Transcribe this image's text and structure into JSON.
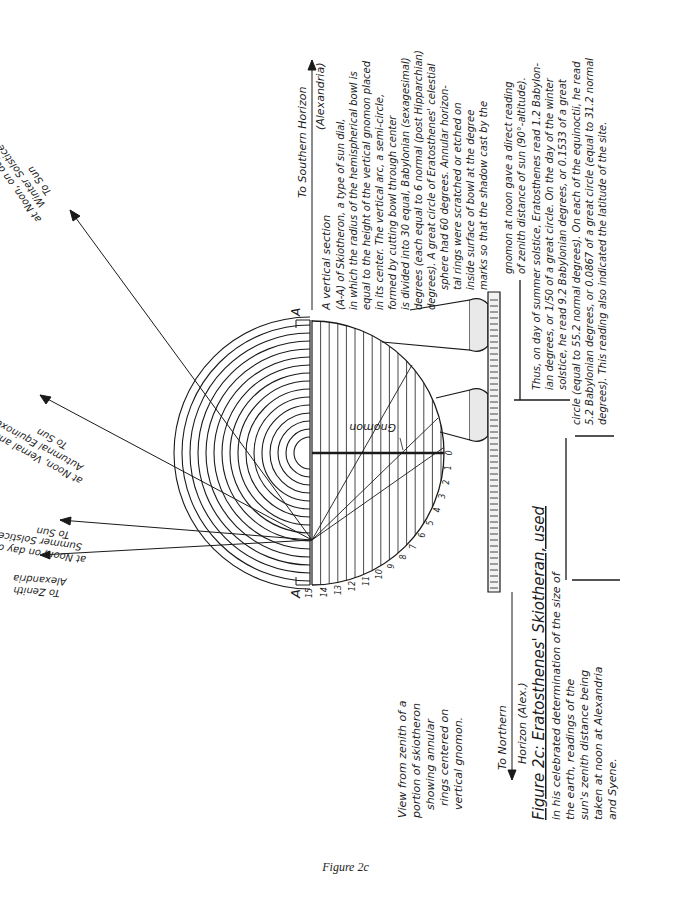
{
  "caption": "Figure 2c",
  "diagram": {
    "title": "Figure 2c: Eratosthenes' Skiotheran, used",
    "title_continuation": [
      "in his celebrated determination of the size of",
      "the earth, readings of the",
      "sun's zenith distance being",
      "taken at noon at Alexandria",
      "and Syene."
    ],
    "plan_view_label": [
      "View from zenith of a",
      "portion of skiotheron",
      "showing annular",
      "rings centered on",
      "vertical gnomon."
    ],
    "section_marker_left": "A",
    "section_marker_right": "A",
    "gnomon_label": "Gnomon",
    "scale_ticks": [
      "0",
      "1",
      "2",
      "3",
      "4",
      "5",
      "6",
      "7",
      "8",
      "9",
      "10",
      "11",
      "12",
      "13",
      "14",
      "15"
    ],
    "north_arrow_label": [
      "To Northern",
      "Horizon (Alex.)"
    ],
    "south_arrow_label": [
      "To Southern Horizon",
      "(Alexandria)"
    ],
    "rays": [
      {
        "id": "zenith",
        "label": [
          "To Zenith",
          "Alexandria"
        ]
      },
      {
        "id": "summer",
        "label": [
          "To Sun",
          "at Noon, on day of",
          "Summer Solstice"
        ]
      },
      {
        "id": "equinox",
        "label": [
          "To Sun",
          "at Noon, Vernal and",
          "Autumnal Equinoxes"
        ]
      },
      {
        "id": "winter",
        "label": [
          "To Sun",
          "at Noon, on day of",
          "Winter Solstice"
        ]
      }
    ],
    "section_description": [
      "A vertical section",
      "(A-A) of Skiotheron, a type of sun dial,",
      "in which the radius of the hemispherical bowl is",
      "equal to the height of the vertical gnomon placed",
      "in its center. The vertical arc, a semi-circle,",
      "formed by cutting bowl through center",
      "is divided into 30 equal, Babylonian (sexagesimal)",
      "degrees (each equal to 6 normal (post Hipparchian)",
      "degrees). A great circle of Eratosthenes' celestial",
      "sphere had 60 degrees. Annular horizon-",
      "tal rings were scratched or etched on",
      "inside surface of bowl at the degree",
      "marks so that the shadow cast by the"
    ],
    "reading_description": [
      "gnomon at noon gave a direct reading",
      "of zenith distance of sun (90°-altitude).",
      "Thus, on day of summer solstice, Eratosthenes read 1.2 Babylon-",
      "ian degrees, or 1/50 of a great circle. On the day of the winter",
      "solstice, he read 9.2 Babylonian degrees, or 0.1533 of a great",
      "circle (equal to 55.2 normal degrees). On each of the equinoctii, he read",
      "5.2 Babylonian degrees, or 0.0867 of a great circle (equal to 31.2 normal",
      "degrees). This reading also indicated the latitude of the site."
    ]
  }
}
